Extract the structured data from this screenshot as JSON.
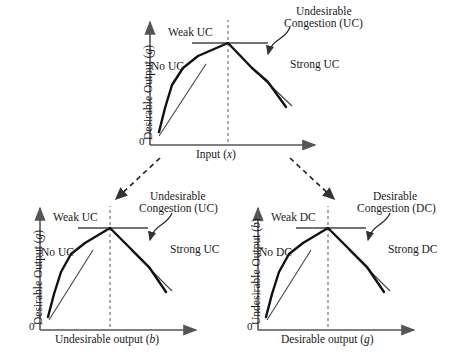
{
  "figure": {
    "title": "",
    "panels": [
      {
        "id": "top",
        "name": "top-panel",
        "y_axis_label": "Desirable Output (g)",
        "x_axis_label": "Input (x)",
        "origin_label": "0",
        "annotations": {
          "weak": "Weak UC",
          "no": "No UC",
          "strong": "Strong UC",
          "congestion_line1": "Undesirable",
          "congestion_line2": "Congestion (UC)"
        }
      },
      {
        "id": "bottom-left",
        "name": "bottom-left-panel",
        "y_axis_label": "Desirable Output (g)",
        "x_axis_label": "Undesirable output (b)",
        "origin_label": "0",
        "annotations": {
          "weak": "Weak UC",
          "no": "No UC",
          "strong": "Strong UC",
          "congestion_line1": "Undesirable",
          "congestion_line2": "Congestion (UC)"
        }
      },
      {
        "id": "bottom-right",
        "name": "bottom-right-panel",
        "y_axis_label": "Undesirable Output (b)",
        "x_axis_label": "Desirable output (g)",
        "origin_label": "0",
        "annotations": {
          "weak": "Weak DC",
          "no": "No DC",
          "strong": "Strong DC",
          "congestion_line1": "Desirable",
          "congestion_line2": "Congestion (DC)"
        }
      }
    ],
    "colors": {
      "curve": "#111111",
      "axis": "#555555",
      "tangent": "#444444",
      "dashed": "#666666",
      "text": "#1a1a1a"
    }
  },
  "chart_data": {
    "type": "line",
    "title": "",
    "panels": [
      {
        "id": "top",
        "title": "",
        "xlabel": "Input (x)",
        "ylabel": "Desirable Output (g)",
        "xlim": [
          0,
          1
        ],
        "ylim": [
          0,
          1
        ],
        "grid": false,
        "legend": "none",
        "series": [
          {
            "name": "production-frontier",
            "x": [
              0.06,
              0.13,
              0.22,
              0.34,
              0.5,
              0.66,
              0.79,
              0.9
            ],
            "y": [
              0.13,
              0.39,
              0.62,
              0.78,
              0.97,
              0.74,
              0.59,
              0.39
            ]
          },
          {
            "name": "no-uc-tangent",
            "x": [
              0.02,
              0.32
            ],
            "y": [
              0.22,
              0.86
            ]
          },
          {
            "name": "weak-uc-tangent",
            "x": [
              0.26,
              0.78
            ],
            "y": [
              0.96,
              0.96
            ]
          },
          {
            "name": "strong-uc-tangent",
            "x": [
              0.6,
              0.88
            ],
            "y": [
              0.76,
              0.48
            ]
          }
        ],
        "peak": {
          "x": 0.5,
          "y": 0.97
        },
        "vertical_dashed_at_x": 0.5,
        "annotations": [
          {
            "text": "Weak UC",
            "x": 0.12,
            "y": 1.05
          },
          {
            "text": "No UC",
            "x": 0.03,
            "y": 0.7
          },
          {
            "text": "Strong UC",
            "x": 0.8,
            "y": 0.72
          },
          {
            "text": "Undesirable Congestion (UC)",
            "x": 0.86,
            "y": 1.1
          }
        ]
      },
      {
        "id": "bottom-left",
        "title": "",
        "xlabel": "Undesirable output (b)",
        "ylabel": "Desirable Output (g)",
        "xlim": [
          0,
          1
        ],
        "ylim": [
          0,
          1
        ],
        "grid": false,
        "legend": "none",
        "series": [
          {
            "name": "production-frontier",
            "x": [
              0.06,
              0.13,
              0.22,
              0.34,
              0.5,
              0.66,
              0.79,
              0.9
            ],
            "y": [
              0.13,
              0.39,
              0.62,
              0.78,
              0.97,
              0.74,
              0.59,
              0.39
            ]
          },
          {
            "name": "no-uc-tangent",
            "x": [
              0.02,
              0.32
            ],
            "y": [
              0.22,
              0.86
            ]
          },
          {
            "name": "weak-uc-tangent",
            "x": [
              0.26,
              0.78
            ],
            "y": [
              0.96,
              0.96
            ]
          },
          {
            "name": "strong-uc-tangent",
            "x": [
              0.6,
              0.88
            ],
            "y": [
              0.76,
              0.48
            ]
          }
        ],
        "peak": {
          "x": 0.5,
          "y": 0.97
        },
        "vertical_dashed_at_x": 0.5,
        "annotations": [
          {
            "text": "Weak UC",
            "x": 0.12,
            "y": 1.05
          },
          {
            "text": "No UC",
            "x": 0.03,
            "y": 0.7
          },
          {
            "text": "Strong UC",
            "x": 0.8,
            "y": 0.72
          },
          {
            "text": "Undesirable Congestion (UC)",
            "x": 0.86,
            "y": 1.1
          }
        ]
      },
      {
        "id": "bottom-right",
        "title": "",
        "xlabel": "Desirable output (g)",
        "ylabel": "Undesirable Output (b)",
        "xlim": [
          0,
          1
        ],
        "ylim": [
          0,
          1
        ],
        "grid": false,
        "legend": "none",
        "series": [
          {
            "name": "production-frontier",
            "x": [
              0.06,
              0.13,
              0.22,
              0.34,
              0.5,
              0.66,
              0.79,
              0.9
            ],
            "y": [
              0.13,
              0.39,
              0.62,
              0.78,
              0.97,
              0.74,
              0.59,
              0.39
            ]
          },
          {
            "name": "no-dc-tangent",
            "x": [
              0.02,
              0.32
            ],
            "y": [
              0.22,
              0.86
            ]
          },
          {
            "name": "weak-dc-tangent",
            "x": [
              0.26,
              0.78
            ],
            "y": [
              0.96,
              0.96
            ]
          },
          {
            "name": "strong-dc-tangent",
            "x": [
              0.6,
              0.88
            ],
            "y": [
              0.76,
              0.48
            ]
          }
        ],
        "peak": {
          "x": 0.5,
          "y": 0.97
        },
        "vertical_dashed_at_x": 0.5,
        "annotations": [
          {
            "text": "Weak DC",
            "x": 0.12,
            "y": 1.05
          },
          {
            "text": "No DC",
            "x": 0.03,
            "y": 0.7
          },
          {
            "text": "Strong DC",
            "x": 0.8,
            "y": 0.72
          },
          {
            "text": "Desirable Congestion (DC)",
            "x": 0.86,
            "y": 1.1
          }
        ]
      }
    ],
    "connectors": [
      {
        "from": "top",
        "to": "bottom-left",
        "style": "dashed-arrow"
      },
      {
        "from": "top",
        "to": "bottom-right",
        "style": "dashed-arrow"
      }
    ]
  }
}
